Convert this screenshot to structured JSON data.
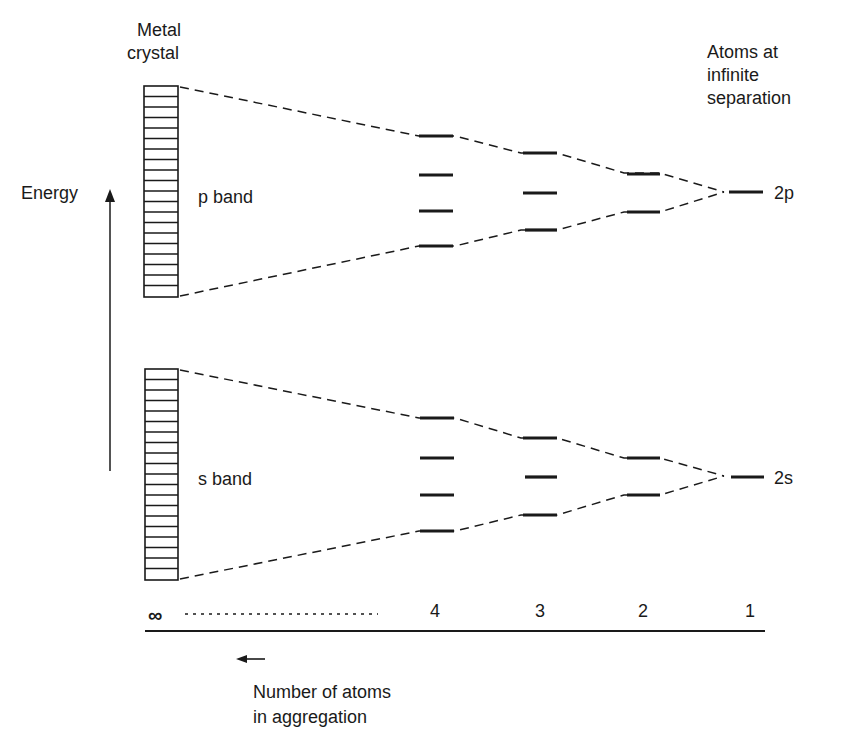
{
  "title_left": [
    "Metal",
    "crystal"
  ],
  "title_right": [
    "Atoms at",
    "infinite",
    "separation"
  ],
  "energy_label": "Energy",
  "bands": [
    {
      "name": "p band",
      "orbital": "2p"
    },
    {
      "name": "s band",
      "orbital": "2s"
    }
  ],
  "axis": {
    "ticks": [
      "∞",
      "4",
      "3",
      "2",
      "1"
    ],
    "caption": [
      "Number of atoms",
      "in aggregation"
    ]
  },
  "colors": {
    "ink": "#1a1a1a",
    "background": "#ffffff"
  }
}
